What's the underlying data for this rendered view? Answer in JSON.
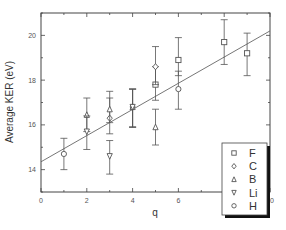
{
  "chart_data": {
    "type": "scatter",
    "title": "",
    "xlabel": "q",
    "ylabel": "Average KER  (eV)",
    "xlim": [
      0,
      10
    ],
    "ylim": [
      13.0,
      21.0
    ],
    "xticks": [
      0,
      2,
      4,
      6,
      8,
      10
    ],
    "yticks": [
      14,
      16,
      18,
      20
    ],
    "grid": false,
    "legend_position": "lower right",
    "series": [
      {
        "name": "F",
        "marker": "square",
        "points": [
          {
            "x": 5,
            "y": 17.8,
            "err_low": 17.1,
            "err_high": 18.6
          },
          {
            "x": 6,
            "y": 18.9,
            "err_low": 18.2,
            "err_high": 19.9
          },
          {
            "x": 8,
            "y": 19.7,
            "err_low": 18.7,
            "err_high": 20.7
          },
          {
            "x": 9,
            "y": 19.2,
            "err_low": 18.2,
            "err_high": 20.1
          }
        ]
      },
      {
        "name": "C",
        "marker": "diamond",
        "points": [
          {
            "x": 3,
            "y": 16.3,
            "err_low": 15.6,
            "err_high": 17.2
          },
          {
            "x": 4,
            "y": 16.8,
            "err_low": 15.9,
            "err_high": 17.6
          },
          {
            "x": 5,
            "y": 18.6,
            "err_low": 17.8,
            "err_high": 19.5
          }
        ]
      },
      {
        "name": "B",
        "marker": "triangle-up",
        "points": [
          {
            "x": 2,
            "y": 16.45,
            "err_low": 15.7,
            "err_high": 17.2
          },
          {
            "x": 3,
            "y": 16.7,
            "err_low": 16.1,
            "err_high": 17.5
          },
          {
            "x": 4,
            "y": 16.8,
            "err_low": 15.9,
            "err_high": 17.6
          },
          {
            "x": 5,
            "y": 15.9,
            "err_low": 15.1,
            "err_high": 16.7
          }
        ]
      },
      {
        "name": "Li",
        "marker": "triangle-down",
        "points": [
          {
            "x": 2,
            "y": 15.7,
            "err_low": 14.9,
            "err_high": 16.4
          },
          {
            "x": 3,
            "y": 14.6,
            "err_low": 13.8,
            "err_high": 15.3
          },
          {
            "x": 4,
            "y": 16.8,
            "err_low": 15.9,
            "err_high": 17.6
          }
        ]
      },
      {
        "name": "H",
        "marker": "circle",
        "points": [
          {
            "x": 1,
            "y": 14.7,
            "err_low": 14.0,
            "err_high": 15.4
          },
          {
            "x": 6,
            "y": 17.6,
            "err_low": 16.7,
            "err_high": 18.4
          }
        ]
      }
    ],
    "fit_line": {
      "x": [
        0,
        10
      ],
      "y": [
        14.35,
        20.2
      ]
    }
  },
  "legend": {
    "entries": [
      {
        "label": "F",
        "marker": "square"
      },
      {
        "label": "C",
        "marker": "diamond"
      },
      {
        "label": "B",
        "marker": "triangle-up"
      },
      {
        "label": "Li",
        "marker": "triangle-down"
      },
      {
        "label": "H",
        "marker": "circle"
      }
    ]
  },
  "colors": {
    "axis": "#444444",
    "marker": "#555555",
    "fit_line": "#666666",
    "legend_shadow": "#111111"
  }
}
